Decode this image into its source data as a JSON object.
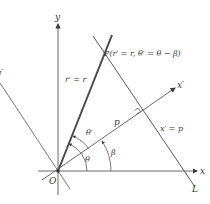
{
  "diagram": {
    "colors": {
      "stroke": "#5a5a5a",
      "thick": "#4a4a4a",
      "text": "#3a3a3a",
      "background": "#ffffff"
    },
    "labels": {
      "y_axis": "y",
      "x_axis": "x",
      "x_prime_axis": "x′",
      "y_prime_axis": "y′",
      "origin": "O",
      "point_P": "P(r′ = r,  θ′ = θ − β)",
      "radius_eq": "r′ = r",
      "line_eq": "x′ = p",
      "line_name": "L",
      "distance": "p",
      "angle_theta": "θ",
      "angle_theta_prime": "θ′",
      "angle_beta": "β"
    }
  }
}
